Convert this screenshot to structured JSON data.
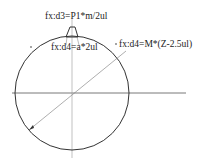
{
  "diagram": {
    "labels": {
      "tooth_width": "fx:d3=P1*m/2ul",
      "tooth_depth": "fx:d4=a*2ul",
      "radius_dim": "fx:d4=M*(Z-2.5ul)"
    },
    "geometry": {
      "circle": {
        "cx": 72,
        "cy": 93,
        "r": 57
      },
      "line_color": "#333333",
      "center_line_color": "#888888"
    }
  }
}
